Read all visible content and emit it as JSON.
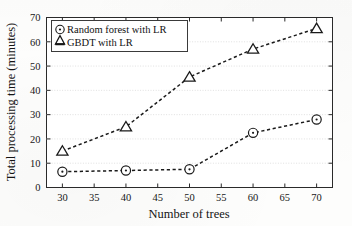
{
  "chart_data": {
    "type": "line",
    "title": "",
    "xlabel": "Number of trees",
    "ylabel": "Total processing time (minutes)",
    "xlim": [
      27.5,
      72.5
    ],
    "ylim": [
      0,
      70
    ],
    "xticks": [
      30,
      35,
      40,
      45,
      50,
      55,
      60,
      65,
      70
    ],
    "yticks": [
      0,
      10,
      20,
      30,
      40,
      50,
      60,
      70
    ],
    "xtick_labels": [
      "30",
      "35",
      "40",
      "45",
      "50",
      "55",
      "60",
      "65",
      "70"
    ],
    "ytick_labels": [
      "0",
      "10",
      "20",
      "30",
      "40",
      "50",
      "60",
      "70"
    ],
    "grid": "horizontal",
    "legend_position": "upper-left",
    "x": [
      30,
      40,
      50,
      60,
      70
    ],
    "series": [
      {
        "name": "Random forest with LR",
        "marker": "circle-dot",
        "linestyle": "dashed",
        "color": "#1a1a1a",
        "values": [
          6.5,
          7.0,
          7.5,
          22.5,
          28.0
        ]
      },
      {
        "name": "GBDT with LR",
        "marker": "triangle",
        "linestyle": "dashed",
        "color": "#1a1a1a",
        "values": [
          15.0,
          25.0,
          45.5,
          57.0,
          65.5
        ]
      }
    ]
  },
  "legend": {
    "entries": [
      {
        "label": "Random forest with LR",
        "marker": "circle-dot-marker"
      },
      {
        "label": "GBDT with LR",
        "marker": "triangle-marker"
      }
    ]
  },
  "axes": {
    "x_title": "Number of trees",
    "y_title": "Total processing time (minutes)"
  }
}
